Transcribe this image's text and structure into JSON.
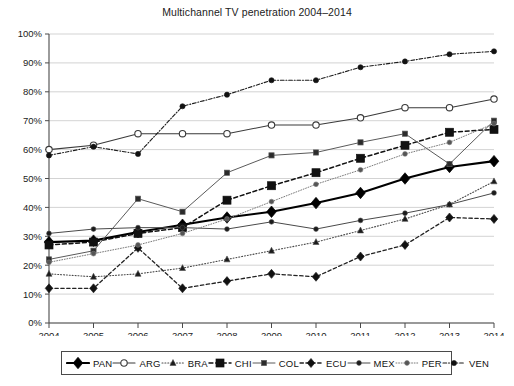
{
  "chart_data": {
    "type": "line",
    "title": "Multichannel TV penetration 2004–2014",
    "xlabel": "",
    "ylabel": "",
    "x": [
      "2004",
      "2005",
      "2006",
      "2007",
      "2008",
      "2009",
      "2010",
      "2011",
      "2012",
      "2013",
      "2014"
    ],
    "categories": [
      "2004",
      "2005",
      "2006",
      "2007",
      "2008",
      "2009",
      "2010",
      "2011",
      "2012",
      "2013",
      "2014"
    ],
    "ylim": [
      0,
      100
    ],
    "ytick_labels": [
      "0%",
      "10%",
      "20%",
      "30%",
      "40%",
      "50%",
      "60%",
      "70%",
      "80%",
      "90%",
      "100%"
    ],
    "ytick_values": [
      0,
      10,
      20,
      30,
      40,
      50,
      60,
      70,
      80,
      90,
      100
    ],
    "grid": true,
    "legend_position": "bottom",
    "value_unit": "%",
    "series": [
      {
        "name": "PAN",
        "label": "PAN",
        "values": [
          28,
          28.5,
          31.5,
          34,
          36.5,
          38.5,
          41.5,
          45,
          50,
          54,
          56
        ],
        "marker": "diamond",
        "dash": "solid",
        "width": 2.1,
        "color": "#000000",
        "fill": "#000000",
        "markersize": 4.6
      },
      {
        "name": "ARG",
        "label": "ARG",
        "values": [
          60,
          61.5,
          65.5,
          65.5,
          65.5,
          68.5,
          68.5,
          71,
          74.5,
          74.5,
          77.5
        ],
        "marker": "circle-open",
        "dash": "solid",
        "width": 1.1,
        "color": "#3a3a3a",
        "fill": "#ffffff",
        "markersize": 3.2
      },
      {
        "name": "BRA",
        "label": "BRA",
        "values": [
          17,
          16,
          17,
          19,
          22,
          25,
          28,
          32,
          36,
          41,
          49
        ],
        "marker": "triangle",
        "dash": "dotted",
        "width": 1.1,
        "color": "#4a4a4a",
        "fill": "#1b1b1b",
        "markersize": 3.0
      },
      {
        "name": "CHI",
        "label": "CHI",
        "values": [
          27,
          28,
          31,
          33,
          42.5,
          47.5,
          52,
          57,
          61.5,
          66,
          67
        ],
        "marker": "square",
        "dash": "dashed",
        "width": 1.5,
        "color": "#111111",
        "fill": "#111111",
        "markersize": 4.0
      },
      {
        "name": "COL",
        "label": "COL",
        "values": [
          22,
          25,
          43,
          38.5,
          52,
          58,
          59,
          62.5,
          65.5,
          55,
          70
        ],
        "marker": "square-small",
        "dash": "solid",
        "width": 1.0,
        "color": "#5a5a5a",
        "fill": "#2b2b2b",
        "markersize": 2.6
      },
      {
        "name": "ECU",
        "label": "ECU",
        "values": [
          12,
          12,
          26,
          12,
          14.5,
          17,
          16,
          23,
          27,
          36.5,
          36
        ],
        "marker": "diamond",
        "dash": "dashed",
        "width": 1.3,
        "color": "#222222",
        "fill": "#111111",
        "markersize": 3.6
      },
      {
        "name": "MEX",
        "label": "MEX",
        "values": [
          31,
          32.5,
          33,
          33,
          32.5,
          35,
          32.5,
          35.5,
          38,
          41,
          45
        ],
        "marker": "dot",
        "dash": "solid",
        "width": 1.0,
        "color": "#4a4a4a",
        "fill": "#1b1b1b",
        "markersize": 2.4
      },
      {
        "name": "PER",
        "label": "PER",
        "values": [
          21,
          24,
          27,
          31,
          36,
          42,
          48,
          53,
          58.5,
          62.5,
          69
        ],
        "marker": "dot-small",
        "dash": "dotted",
        "width": 1.0,
        "color": "#7a7a7a",
        "fill": "#555555",
        "markersize": 2.4
      },
      {
        "name": "VEN",
        "label": "VEN",
        "values": [
          58,
          61,
          58.5,
          75,
          79,
          84,
          84,
          88.5,
          90.5,
          93,
          94
        ],
        "marker": "dot",
        "dash": "dashdot",
        "width": 1.1,
        "color": "#1b1b1b",
        "fill": "#111111",
        "markersize": 2.6
      }
    ]
  },
  "legend": {
    "items": [
      {
        "label": "PAN"
      },
      {
        "label": "ARG"
      },
      {
        "label": "BRA"
      },
      {
        "label": "CHI"
      },
      {
        "label": "COL"
      },
      {
        "label": "ECU"
      },
      {
        "label": "MEX"
      },
      {
        "label": "PER"
      },
      {
        "label": "VEN"
      }
    ]
  }
}
